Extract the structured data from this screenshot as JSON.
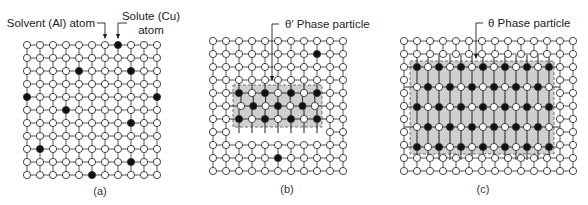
{
  "figure": {
    "panels": [
      {
        "id": "a",
        "caption": "(a)",
        "caption_pos": [
          100,
          195
        ],
        "grid": {
          "x0": 27,
          "y0": 45,
          "cols": 11,
          "rows": 11,
          "dx": 13,
          "dy": 13
        },
        "solute_atoms": [
          [
            7,
            0
          ],
          [
            4,
            2
          ],
          [
            8,
            2
          ],
          [
            0,
            4
          ],
          [
            10,
            4
          ],
          [
            3,
            5
          ],
          [
            8,
            6
          ],
          [
            1,
            8
          ],
          [
            8,
            9
          ],
          [
            5,
            10
          ]
        ],
        "particle": null,
        "annotations": [
          {
            "text": "Solvent (Al) atom",
            "x": 95,
            "y": 27,
            "anchor": "end",
            "line": [
              [
                97,
                23
              ],
              [
                105,
                23
              ],
              [
                105,
                38
              ]
            ]
          },
          {
            "text": "Solute (Cu)",
            "text2": "atom",
            "x": 151,
            "y": 20,
            "y2": 34,
            "anchor": "middle",
            "line": [
              [
                127,
                23
              ],
              [
                118,
                23
              ],
              [
                118,
                38
              ]
            ]
          }
        ]
      },
      {
        "id": "b",
        "caption": "(b)",
        "caption_pos": [
          287,
          193
        ],
        "grid": {
          "x0": 213,
          "y0": 41,
          "cols": 11,
          "rows": 11,
          "dx": 13,
          "dy": 13
        },
        "solute_atoms": [
          [
            8,
            1
          ],
          [
            5,
            9
          ]
        ],
        "particle": {
          "box": [
            233,
            85,
            89,
            42
          ],
          "rows": [
            {
              "y": 93,
              "x0": 239,
              "dx": 13,
              "pattern": "FOFOFOF"
            },
            {
              "y": 106,
              "x0": 241,
              "dx": 12.3,
              "pattern": "OFOFOFO"
            },
            {
              "y": 119,
              "x0": 239,
              "dx": 13,
              "pattern": "FOFOFOF"
            }
          ],
          "hide_cols": [
            2,
            3,
            4,
            5,
            6,
            7,
            8
          ],
          "hide_rows": [
            4,
            5,
            6,
            7
          ]
        },
        "annotations": [
          {
            "text": "θ′ Phase particle",
            "x": 285,
            "y": 28,
            "anchor": "start",
            "line": [
              [
                279,
                24
              ],
              [
                272,
                24
              ],
              [
                272,
                80
              ]
            ]
          }
        ]
      },
      {
        "id": "c",
        "caption": "(c)",
        "caption_pos": [
          483,
          193
        ],
        "grid": {
          "x0": 404,
          "y0": 41,
          "cols": 14,
          "rows": 11,
          "dx": 13,
          "dy": 13
        },
        "solute_atoms": [],
        "particle": {
          "box": [
            410,
            61,
            144,
            93
          ],
          "rows": [
            {
              "y": 67,
              "x0": 417,
              "dx": 11,
              "pattern": "FOFOFOFOFOFOF"
            },
            {
              "y": 87,
              "x0": 417,
              "dx": 11,
              "pattern": "OFOFOFOFOFOFO"
            },
            {
              "y": 107,
              "x0": 417,
              "dx": 11,
              "pattern": "FOFOFOFOFOFOF"
            },
            {
              "y": 127,
              "x0": 417,
              "dx": 11,
              "pattern": "OFOFOFOFOFOFO"
            },
            {
              "y": 147,
              "x0": 417,
              "dx": 11,
              "pattern": "FOFOFOFOFOFOF"
            }
          ],
          "hide_cols": [
            1,
            2,
            3,
            4,
            5,
            6,
            7,
            8,
            9,
            10,
            11
          ],
          "hide_rows": [
            2,
            3,
            4,
            5,
            6,
            7,
            8
          ]
        },
        "annotations": [
          {
            "text": "θ Phase particle",
            "x": 488,
            "y": 27,
            "anchor": "start",
            "line": [
              [
                483,
                23
              ],
              [
                476,
                23
              ],
              [
                476,
                58
              ]
            ]
          }
        ]
      }
    ],
    "colors": {
      "bond": "#555555",
      "atom_fill": "#ffffff",
      "atom_stroke": "#333333",
      "solute_fill": "#111111",
      "particle_fill": "#cfcfcf",
      "particle_stroke": "#666666",
      "text": "#222222"
    },
    "legend_terms": {
      "solvent": "Solvent (Al) atom",
      "solute": "Solute (Cu) atom",
      "theta_prime": "θ′ Phase particle",
      "theta": "θ Phase particle"
    }
  }
}
